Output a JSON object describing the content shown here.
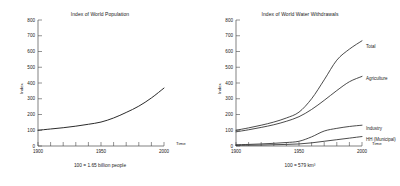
{
  "figure": {
    "background": "#ffffff",
    "line_color": "#2b2b2b",
    "axis_color": "#4a4a4a"
  },
  "chart_data": [
    {
      "type": "line",
      "title": "Index of World Population",
      "xlabel": "Time",
      "ylabel": "Index",
      "caption": "100 = 1.65 billion people",
      "xlim": [
        1900,
        2000
      ],
      "ylim": [
        0,
        800
      ],
      "grid": false,
      "legend_position": "none",
      "xticks": [
        1900,
        1910,
        1920,
        1930,
        1940,
        1950,
        1960,
        1970,
        1980,
        1990,
        2000
      ],
      "xtick_labels": [
        "1900",
        "1950",
        "2000"
      ],
      "xtick_labels_at": [
        1900,
        1950,
        2000
      ],
      "yticks": [
        0,
        100,
        200,
        300,
        400,
        500,
        600,
        700,
        800
      ],
      "ytick_labels": [
        "0",
        "100",
        "200",
        "300",
        "400",
        "500",
        "600",
        "700",
        "800"
      ],
      "x": [
        1900,
        1910,
        1920,
        1930,
        1940,
        1950,
        1960,
        1970,
        1980,
        1990,
        2000
      ],
      "series": [
        {
          "name": "World Population",
          "values": [
            100,
            108,
            116,
            126,
            138,
            152,
            178,
            213,
            253,
            305,
            368
          ]
        }
      ]
    },
    {
      "type": "line",
      "title": "Index of World Water Withdrawals",
      "xlabel": "Time",
      "ylabel": "Index",
      "caption": "100 = 579 km³",
      "xlim": [
        1900,
        2000
      ],
      "ylim": [
        0,
        800
      ],
      "grid": false,
      "legend_position": "right-inline",
      "xticks": [
        1900,
        1910,
        1920,
        1930,
        1940,
        1950,
        1960,
        1970,
        1980,
        1990,
        2000
      ],
      "xtick_labels": [
        "1900",
        "1950",
        "2000"
      ],
      "xtick_labels_at": [
        1900,
        1950,
        2000
      ],
      "yticks": [
        0,
        100,
        200,
        300,
        400,
        500,
        600,
        700,
        800
      ],
      "ytick_labels": [
        "0",
        "100",
        "200",
        "300",
        "400",
        "500",
        "600",
        "700",
        "800"
      ],
      "x": [
        1900,
        1910,
        1920,
        1930,
        1940,
        1950,
        1960,
        1970,
        1980,
        1990,
        2000
      ],
      "series": [
        {
          "name": "Total",
          "values": [
            100,
            115,
            132,
            152,
            178,
            215,
            300,
            420,
            545,
            615,
            668
          ]
        },
        {
          "name": "Agriculture",
          "values": [
            90,
            103,
            118,
            135,
            157,
            186,
            232,
            290,
            352,
            408,
            442
          ]
        },
        {
          "name": "Industry",
          "values": [
            8,
            10,
            13,
            17,
            22,
            30,
            58,
            95,
            112,
            124,
            132
          ]
        },
        {
          "name": "HH (Municipal)",
          "values": [
            4,
            5,
            6,
            8,
            10,
            13,
            20,
            30,
            40,
            50,
            60
          ]
        }
      ]
    }
  ]
}
